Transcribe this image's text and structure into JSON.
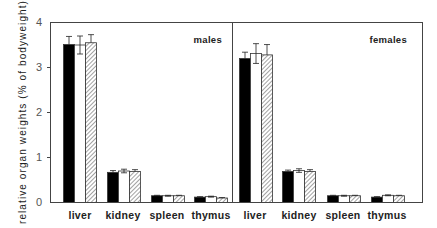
{
  "chart_data": {
    "type": "bar",
    "title": "",
    "xlabel": "",
    "ylabel": "relative organ weights (% of bodyweight)",
    "ylim": [
      0,
      4
    ],
    "yticks": [
      0,
      1,
      2,
      3,
      4
    ],
    "grid": false,
    "legend": "none shown (black, white, hatched bars = three groups)",
    "categories": [
      "liver",
      "kidney",
      "spleen",
      "thymus"
    ],
    "panels": [
      {
        "name": "males",
        "series": [
          {
            "name": "black",
            "fill": "solid-black",
            "values": [
              3.51,
              0.67,
              0.15,
              0.12
            ],
            "errors": [
              0.18,
              0.04,
              0.01,
              0.01
            ]
          },
          {
            "name": "white",
            "fill": "white",
            "values": [
              3.5,
              0.7,
              0.15,
              0.13
            ],
            "errors": [
              0.2,
              0.04,
              0.01,
              0.01
            ]
          },
          {
            "name": "hatched",
            "fill": "diagonal-hatch",
            "values": [
              3.55,
              0.69,
              0.15,
              0.1
            ],
            "errors": [
              0.18,
              0.04,
              0.01,
              0.01
            ]
          }
        ]
      },
      {
        "name": "females",
        "series": [
          {
            "name": "black",
            "fill": "solid-black",
            "values": [
              3.2,
              0.69,
              0.15,
              0.12
            ],
            "errors": [
              0.14,
              0.03,
              0.01,
              0.01
            ]
          },
          {
            "name": "white",
            "fill": "white",
            "values": [
              3.31,
              0.71,
              0.15,
              0.16
            ],
            "errors": [
              0.22,
              0.04,
              0.01,
              0.01
            ]
          },
          {
            "name": "hatched",
            "fill": "diagonal-hatch",
            "values": [
              3.28,
              0.69,
              0.15,
              0.15
            ],
            "errors": [
              0.23,
              0.04,
              0.01,
              0.01
            ]
          }
        ]
      }
    ]
  },
  "labels": {
    "ylabel": "relative organ weights (% of bodyweight)",
    "panel_males": "males",
    "panel_females": "females",
    "categories": [
      "liver",
      "kidney",
      "spleen",
      "thymus"
    ],
    "yticks": [
      "0",
      "1",
      "2",
      "3",
      "4"
    ]
  },
  "colors": {
    "bar_black": "#000000",
    "bar_white": "#ffffff",
    "hatch": "#555555",
    "axis": "#444444"
  }
}
